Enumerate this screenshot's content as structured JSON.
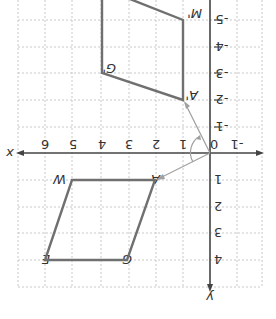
{
  "diagram": {
    "orientation": "rotated 180 degrees",
    "axes": {
      "x_label": "x",
      "y_label": "y",
      "x_ticks": [
        "-1",
        "0",
        "1",
        "2",
        "3",
        "4",
        "5",
        "6"
      ],
      "y_ticks": [
        "4",
        "3",
        "2",
        "1",
        "-1",
        "-2",
        "-3",
        "-4",
        "-5"
      ]
    },
    "shapes": {
      "original": {
        "name": "WAGE",
        "vertices": [
          {
            "label": "W",
            "coord": [
              5,
              1
            ]
          },
          {
            "label": "A",
            "coord": [
              2,
              1
            ]
          },
          {
            "label": "G",
            "coord": [
              3,
              4
            ]
          },
          {
            "label": "E",
            "coord": [
              6,
              4
            ]
          }
        ]
      },
      "image": {
        "name": "W'A'G'E'",
        "vertices": [
          {
            "label": "A'",
            "coord": [
              1,
              -2
            ]
          },
          {
            "label": "M'",
            "coord": [
              1,
              -5
            ]
          },
          {
            "label": "G'",
            "coord": [
              4,
              -3
            ]
          }
        ]
      }
    },
    "rotation_arrows": {
      "from": "A",
      "to": "A'",
      "center": "0"
    },
    "colors": {
      "shape_stroke": "#707070",
      "grid": "#c8c8c8",
      "axis": "#444444",
      "arrow": "#a0a0a0"
    }
  }
}
